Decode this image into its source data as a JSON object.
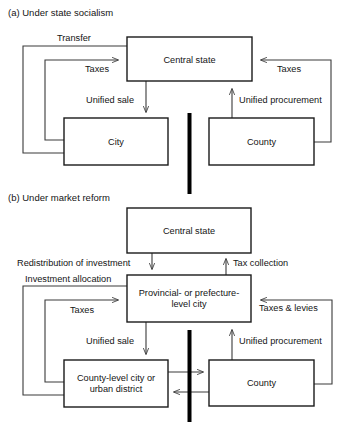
{
  "figure": {
    "panels": [
      {
        "id": "panel-a",
        "title": "(a) Under state socialism",
        "boxes": [
          {
            "id": "a-central-state",
            "label": "Central state"
          },
          {
            "id": "a-city",
            "label": "City"
          },
          {
            "id": "a-county",
            "label": "County"
          }
        ],
        "edge_labels": [
          {
            "id": "a-transfer",
            "text": "Transfer"
          },
          {
            "id": "a-taxes-city",
            "text": "Taxes"
          },
          {
            "id": "a-unified-sale",
            "text": "Unified sale"
          },
          {
            "id": "a-taxes-county",
            "text": "Taxes"
          },
          {
            "id": "a-unified-procurement",
            "text": "Unified procurement"
          }
        ]
      },
      {
        "id": "panel-b",
        "title": "(b) Under market reform",
        "boxes": [
          {
            "id": "b-central-state",
            "label": "Central state"
          },
          {
            "id": "b-provincial-city",
            "label_line1": "Provincial- or prefecture-",
            "label_line2": "level city"
          },
          {
            "id": "b-county-level-city",
            "label_line1": "County-level city or",
            "label_line2": "urban district"
          },
          {
            "id": "b-county",
            "label": "County"
          }
        ],
        "edge_labels": [
          {
            "id": "b-redistribution",
            "text": "Redistribution of investment"
          },
          {
            "id": "b-investment-allocation",
            "text": "Investment allocation"
          },
          {
            "id": "b-tax-collection",
            "text": "Tax collection"
          },
          {
            "id": "b-taxes",
            "text": "Taxes"
          },
          {
            "id": "b-taxes-levies",
            "text": "Taxes & levies"
          },
          {
            "id": "b-unified-sale",
            "text": "Unified sale"
          },
          {
            "id": "b-unified-procurement",
            "text": "Unified procurement"
          }
        ]
      }
    ],
    "colors": {
      "background": "#ffffff",
      "box_stroke": "#1a1a1a",
      "flow_stroke": "#3a3a3a",
      "divider": "#000000",
      "text": "#141414"
    }
  }
}
